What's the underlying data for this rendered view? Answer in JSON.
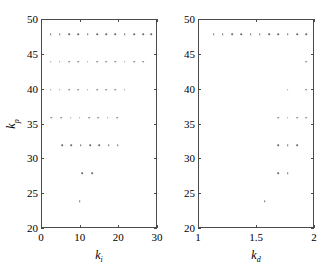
{
  "figure": {
    "background": "#ffffff",
    "axis_color": "#4a4a4a",
    "marker_color": "#6b6b6b"
  },
  "chart_data": [
    {
      "type": "scatter",
      "panel": "left",
      "title": "",
      "xlabel": "k_i",
      "ylabel": "k_p",
      "xlabel_base": "k",
      "xlabel_sub": "i",
      "ylabel_base": "k",
      "ylabel_sub": "p",
      "xlim": [
        0,
        30
      ],
      "ylim": [
        20,
        50
      ],
      "xticks": [
        0,
        10,
        20,
        30
      ],
      "xticklabels": [
        "0",
        "10",
        "20",
        "30"
      ],
      "yticks": [
        20,
        25,
        30,
        35,
        40,
        45,
        50
      ],
      "yticklabels": [
        "20",
        "25",
        "30",
        "35",
        "40",
        "45",
        "50"
      ],
      "grid": false,
      "legend": null,
      "points": [
        {
          "x": 2.2,
          "y": 48
        },
        {
          "x": 4.6,
          "y": 48
        },
        {
          "x": 7.0,
          "y": 48
        },
        {
          "x": 9.4,
          "y": 48
        },
        {
          "x": 11.8,
          "y": 48
        },
        {
          "x": 14.2,
          "y": 48
        },
        {
          "x": 16.6,
          "y": 48
        },
        {
          "x": 19.0,
          "y": 48
        },
        {
          "x": 21.4,
          "y": 48
        },
        {
          "x": 23.8,
          "y": 48
        },
        {
          "x": 26.2,
          "y": 48
        },
        {
          "x": 28.2,
          "y": 48
        },
        {
          "x": 2.2,
          "y": 44
        },
        {
          "x": 4.6,
          "y": 44
        },
        {
          "x": 7.0,
          "y": 44
        },
        {
          "x": 9.4,
          "y": 44
        },
        {
          "x": 11.8,
          "y": 44
        },
        {
          "x": 14.2,
          "y": 44
        },
        {
          "x": 16.6,
          "y": 44
        },
        {
          "x": 19.0,
          "y": 44
        },
        {
          "x": 21.4,
          "y": 44
        },
        {
          "x": 23.8,
          "y": 44
        },
        {
          "x": 26.2,
          "y": 44
        },
        {
          "x": 2.2,
          "y": 40
        },
        {
          "x": 4.6,
          "y": 40
        },
        {
          "x": 7.0,
          "y": 40
        },
        {
          "x": 9.4,
          "y": 40
        },
        {
          "x": 11.8,
          "y": 40
        },
        {
          "x": 14.2,
          "y": 40
        },
        {
          "x": 16.6,
          "y": 40
        },
        {
          "x": 19.0,
          "y": 40
        },
        {
          "x": 21.4,
          "y": 40
        },
        {
          "x": 2.4,
          "y": 36
        },
        {
          "x": 5.0,
          "y": 36
        },
        {
          "x": 7.4,
          "y": 36
        },
        {
          "x": 9.8,
          "y": 36
        },
        {
          "x": 12.2,
          "y": 36
        },
        {
          "x": 14.6,
          "y": 36
        },
        {
          "x": 17.0,
          "y": 36
        },
        {
          "x": 19.4,
          "y": 36
        },
        {
          "x": 5.2,
          "y": 32
        },
        {
          "x": 7.6,
          "y": 32
        },
        {
          "x": 10.0,
          "y": 32
        },
        {
          "x": 12.4,
          "y": 32
        },
        {
          "x": 14.8,
          "y": 32
        },
        {
          "x": 17.2,
          "y": 32
        },
        {
          "x": 19.6,
          "y": 32
        },
        {
          "x": 10.4,
          "y": 28
        },
        {
          "x": 13.0,
          "y": 28
        },
        {
          "x": 9.8,
          "y": 24
        }
      ]
    },
    {
      "type": "scatter",
      "panel": "right",
      "title": "",
      "xlabel": "k_d",
      "ylabel": "k_p",
      "xlabel_base": "k",
      "xlabel_sub": "d",
      "ylabel_base": "k",
      "ylabel_sub": "p",
      "xlim": [
        1,
        2
      ],
      "ylim": [
        20,
        50
      ],
      "xticks": [
        1,
        1.5,
        2
      ],
      "xticklabels": [
        "1",
        "1.5",
        "2"
      ],
      "yticks": [
        20,
        25,
        30,
        35,
        40,
        45,
        50
      ],
      "yticklabels": [
        "20",
        "25",
        "30",
        "35",
        "40",
        "45",
        "50"
      ],
      "grid": false,
      "legend": null,
      "points": [
        {
          "x": 1.125,
          "y": 48
        },
        {
          "x": 1.205,
          "y": 48
        },
        {
          "x": 1.285,
          "y": 48
        },
        {
          "x": 1.365,
          "y": 48
        },
        {
          "x": 1.445,
          "y": 48
        },
        {
          "x": 1.525,
          "y": 48
        },
        {
          "x": 1.605,
          "y": 48
        },
        {
          "x": 1.685,
          "y": 48
        },
        {
          "x": 1.765,
          "y": 48
        },
        {
          "x": 1.845,
          "y": 48
        },
        {
          "x": 1.925,
          "y": 48
        },
        {
          "x": 1.925,
          "y": 44
        },
        {
          "x": 1.765,
          "y": 40
        },
        {
          "x": 1.925,
          "y": 40
        },
        {
          "x": 1.685,
          "y": 36
        },
        {
          "x": 1.765,
          "y": 36
        },
        {
          "x": 1.845,
          "y": 36
        },
        {
          "x": 1.925,
          "y": 36
        },
        {
          "x": 1.685,
          "y": 32
        },
        {
          "x": 1.765,
          "y": 32
        },
        {
          "x": 1.845,
          "y": 32
        },
        {
          "x": 1.685,
          "y": 28
        },
        {
          "x": 1.765,
          "y": 28
        },
        {
          "x": 1.565,
          "y": 24
        }
      ]
    }
  ]
}
